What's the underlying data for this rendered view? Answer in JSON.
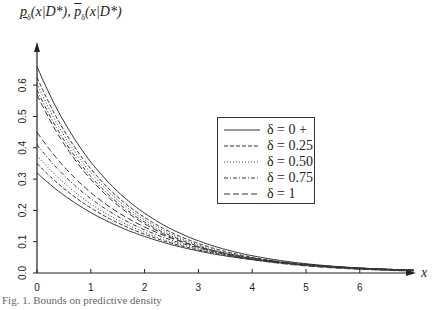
{
  "chart_data": {
    "type": "line",
    "title": "",
    "ylabel": "p_δ(x|D*), p̄_δ(x|D*)",
    "xlabel": "x",
    "xlim": [
      0,
      7
    ],
    "ylim": [
      0,
      0.7
    ],
    "x_ticks": [
      "0",
      "1",
      "2",
      "3",
      "4",
      "5",
      "6"
    ],
    "y_ticks": [
      "0.0",
      "0.1",
      "0.2",
      "0.3",
      "0.4",
      "0.5",
      "0.6"
    ],
    "grid": false,
    "legend_position": "upper right (inside)",
    "legend": [
      "δ = 0 +",
      "δ = 0.25",
      "δ = 0.50",
      "δ = 0.75",
      "δ = 1"
    ],
    "series": [
      {
        "name": "δ = 0 + (upper)",
        "style": "solid",
        "y0": 0.66,
        "decay": 0.62
      },
      {
        "name": "δ = 0.25 (upper)",
        "style": "dashed",
        "y0": 0.625,
        "decay": 0.63
      },
      {
        "name": "δ = 0.50 (upper)",
        "style": "dotted",
        "y0": 0.605,
        "decay": 0.635
      },
      {
        "name": "δ = 0.75 (upper)",
        "style": "dashdot",
        "y0": 0.585,
        "decay": 0.64
      },
      {
        "name": "δ = 1 (upper)",
        "style": "longdash",
        "y0": 0.57,
        "decay": 0.645
      },
      {
        "name": "δ = 1 (lower)",
        "style": "longdash",
        "y0": 0.45,
        "decay": 0.56
      },
      {
        "name": "δ = 0.75 (lower)",
        "style": "dashdot",
        "y0": 0.41,
        "decay": 0.545
      },
      {
        "name": "δ = 0.50 (lower)",
        "style": "dotted",
        "y0": 0.375,
        "decay": 0.53
      },
      {
        "name": "δ = 0.25 (lower)",
        "style": "dashed",
        "y0": 0.35,
        "decay": 0.52
      },
      {
        "name": "δ = 0 + (lower)",
        "style": "solid",
        "y0": 0.32,
        "decay": 0.505
      }
    ]
  },
  "labels": {
    "ylabel": "p(x|D*), p̄(x|D*)",
    "xlabel": "x",
    "caption": "Fig. 1. Bounds on predictive density"
  }
}
